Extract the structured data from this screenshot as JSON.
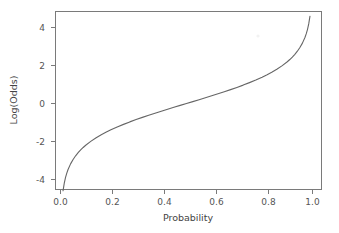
{
  "chart_data": {
    "type": "line",
    "title": "",
    "subtitle": "",
    "xlabel": "Probability",
    "ylabel": "Log(Odds)",
    "xlim": [
      -0.04,
      1.05
    ],
    "ylim": [
      -5.0,
      5.0
    ],
    "grid": false,
    "legend": null,
    "legend_position": "none",
    "line_color": "#666666",
    "frame_color": "#7a7a7a",
    "background_color": "#ffffff",
    "xticks": [
      0.0,
      0.2,
      0.4,
      0.6,
      0.8,
      1.0
    ],
    "xtick_labels": [
      "0.0",
      "0.2",
      "0.4",
      "0.6",
      "0.8",
      "1.0"
    ],
    "yticks": [
      -4,
      -2,
      0,
      2,
      4
    ],
    "ytick_labels": [
      "-4",
      "-2",
      "0",
      "2",
      "4"
    ],
    "series": [
      {
        "name": "Log(Odds) = ln(p/(1-p))",
        "x": [
          0.01,
          0.015,
          0.02,
          0.025,
          0.03,
          0.04,
          0.05,
          0.06,
          0.07,
          0.08,
          0.09,
          0.1,
          0.12,
          0.14,
          0.16,
          0.18,
          0.2,
          0.225,
          0.25,
          0.275,
          0.3,
          0.325,
          0.35,
          0.375,
          0.4,
          0.425,
          0.45,
          0.475,
          0.5,
          0.525,
          0.55,
          0.575,
          0.6,
          0.625,
          0.65,
          0.675,
          0.7,
          0.725,
          0.75,
          0.775,
          0.8,
          0.82,
          0.84,
          0.86,
          0.88,
          0.9,
          0.91,
          0.92,
          0.93,
          0.94,
          0.95,
          0.96,
          0.97,
          0.975,
          0.98,
          0.985,
          0.99
        ],
        "y": [
          -4.595,
          -4.19,
          -3.892,
          -3.664,
          -3.476,
          -3.178,
          -2.944,
          -2.752,
          -2.587,
          -2.442,
          -2.314,
          -2.197,
          -1.992,
          -1.815,
          -1.658,
          -1.516,
          -1.386,
          -1.237,
          -1.099,
          -0.968,
          -0.847,
          -0.731,
          -0.619,
          -0.511,
          -0.405,
          -0.302,
          -0.201,
          -0.1,
          0.0,
          0.1,
          0.201,
          0.302,
          0.405,
          0.511,
          0.619,
          0.731,
          0.847,
          0.968,
          1.099,
          1.237,
          1.386,
          1.516,
          1.658,
          1.815,
          1.992,
          2.197,
          2.314,
          2.442,
          2.587,
          2.752,
          2.944,
          3.178,
          3.476,
          3.664,
          3.892,
          4.19,
          4.595
        ]
      }
    ],
    "annotations": []
  }
}
